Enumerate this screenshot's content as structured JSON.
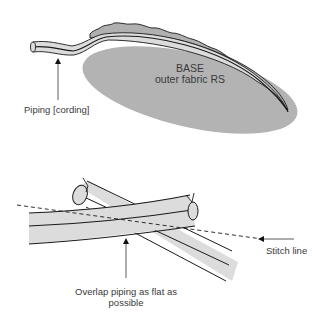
{
  "figure_top": {
    "title_line1": "BASE",
    "title_line2": "outer fabric RS",
    "piping_label": "Piping [cording]"
  },
  "figure_bottom": {
    "stitch_label": "Stitch line",
    "caption_line1": "Overlap piping as flat as",
    "caption_line2": "possible"
  },
  "colors": {
    "fabric": "#b4b4b4",
    "piping": "#dcdcdc",
    "outline": "#1a1a1a"
  }
}
